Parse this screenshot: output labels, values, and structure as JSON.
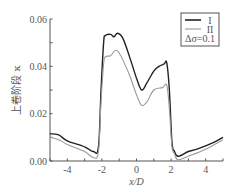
{
  "chart_data": {
    "type": "line",
    "title": "",
    "xlabel": "x/D",
    "ylabel": "上卷阶段 κ",
    "xlim": [
      -5,
      5
    ],
    "ylim": [
      0,
      0.06
    ],
    "xticks": [
      -4,
      -2,
      0,
      2,
      4
    ],
    "xtick_labels": [
      "-4",
      "-2",
      "0",
      "2",
      "4"
    ],
    "yticks": [
      0,
      0.02,
      0.04,
      0.06
    ],
    "ytick_labels": [
      "0.00",
      "0.02",
      "0.04",
      "0.06"
    ],
    "grid": false,
    "legend": {
      "position": "upper right",
      "entries": [
        "I",
        "II"
      ],
      "annotation": "Δσ=0.1"
    },
    "series": [
      {
        "name": "I",
        "color": "#222222",
        "x": [
          -5,
          -4.5,
          -4,
          -3,
          -2.5,
          -2.2,
          -2.05,
          -1.9,
          -1.8,
          -1.5,
          -1.3,
          -1.1,
          -0.8,
          -0.4,
          0,
          0.3,
          0.6,
          1.0,
          1.3,
          1.6,
          1.75,
          1.9,
          2.05,
          2.2,
          2.4,
          3,
          3.5,
          4.5,
          5
        ],
        "y": [
          0.0115,
          0.011,
          0.0085,
          0.006,
          0.004,
          0.006,
          0.03,
          0.05,
          0.053,
          0.0535,
          0.0525,
          0.054,
          0.052,
          0.044,
          0.035,
          0.03,
          0.033,
          0.038,
          0.04,
          0.041,
          0.0415,
          0.03,
          0.008,
          0.004,
          0.002,
          0.004,
          0.005,
          0.008,
          0.01
        ]
      },
      {
        "name": "II",
        "color": "#9a9a9a",
        "x": [
          -5,
          -4.5,
          -4,
          -3,
          -2.5,
          -2.2,
          -2.05,
          -1.9,
          -1.8,
          -1.5,
          -1.1,
          -0.5,
          0,
          0.3,
          0.6,
          1.0,
          1.5,
          1.75,
          1.9,
          2.05,
          2.2,
          2.4,
          3,
          4,
          5
        ],
        "y": [
          0.01,
          0.009,
          0.007,
          0.004,
          0.0015,
          0.004,
          0.025,
          0.041,
          0.044,
          0.0445,
          0.0465,
          0.038,
          0.028,
          0.0235,
          0.025,
          0.03,
          0.031,
          0.032,
          0.022,
          0.006,
          0.003,
          0.0005,
          0.002,
          0.005,
          0.009
        ]
      }
    ]
  }
}
